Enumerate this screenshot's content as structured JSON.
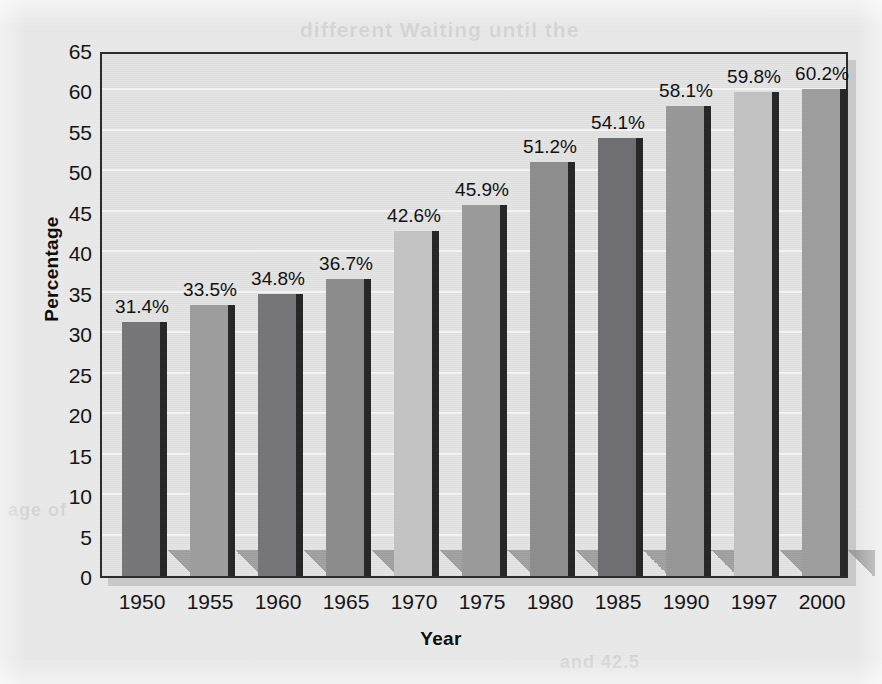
{
  "document": {
    "kind": "scanned-page-bar-chart",
    "bleed_through_text": [
      "different   Waiting  until the",
      "in the numbers of",
      "age of",
      "and 42.5"
    ]
  },
  "chart_data": {
    "type": "bar",
    "title": "",
    "xlabel": "Year",
    "ylabel": "Percentage",
    "categories": [
      "1950",
      "1955",
      "1960",
      "1965",
      "1970",
      "1975",
      "1980",
      "1985",
      "1990",
      "1997",
      "2000"
    ],
    "values": [
      31.4,
      33.5,
      34.8,
      36.7,
      42.6,
      45.9,
      51.2,
      54.1,
      58.1,
      59.8,
      60.2
    ],
    "data_labels": [
      "31.4%",
      "33.5%",
      "34.8%",
      "36.7%",
      "42.6%",
      "45.9%",
      "51.2%",
      "54.1%",
      "58.1%",
      "59.8%",
      "60.2%"
    ],
    "bar_colors": [
      "#77777a",
      "#9d9d9d",
      "#76767a",
      "#8d8d8d",
      "#c3c3c3",
      "#9b9b9b",
      "#8e8e8e",
      "#6e6e72",
      "#989898",
      "#c2c2c2",
      "#9e9e9e"
    ],
    "ylim": [
      0,
      65
    ],
    "ytick_values": [
      0,
      5,
      10,
      15,
      20,
      25,
      30,
      35,
      40,
      45,
      50,
      55,
      60,
      65
    ],
    "ytick_labels": [
      "0",
      "5",
      "10",
      "15",
      "20",
      "25",
      "30",
      "35",
      "40",
      "45",
      "50",
      "55",
      "60",
      "65"
    ],
    "grid": true,
    "grid_color": "#f4f4f4",
    "legend": null,
    "plot_background": "#e4e4e4",
    "page_background": "#e9e9e9",
    "axis_color": "#2b2b2b"
  }
}
